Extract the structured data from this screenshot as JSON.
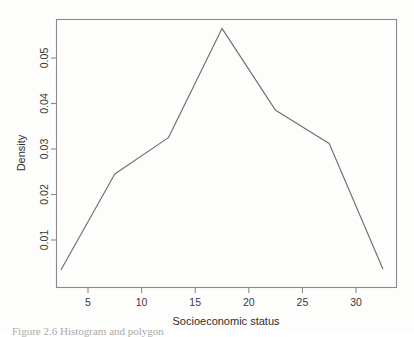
{
  "figure": {
    "caption": "Figure 2.6  Histogram and polygon",
    "background_color": "#fdfdfc",
    "line_color": "#6f6f6f",
    "axis_color": "#8a8a8a"
  },
  "chart_data": {
    "type": "line",
    "title": "",
    "subtitle": "",
    "xlabel": "Socioeconomic status",
    "ylabel": "Density",
    "x": [
      2.5,
      7.5,
      12.5,
      17.5,
      22.5,
      27.5,
      32.5
    ],
    "values": [
      0.0035,
      0.0245,
      0.0325,
      0.0565,
      0.0385,
      0.0312,
      0.0037
    ],
    "series": [
      {
        "name": "Density",
        "values": [
          0.0035,
          0.0245,
          0.0325,
          0.0565,
          0.0385,
          0.0312,
          0.0037
        ]
      }
    ],
    "xlim": [
      1.8,
      33.5
    ],
    "ylim": [
      0.0022,
      0.0585
    ],
    "xticks": [
      5,
      10,
      15,
      20,
      25,
      30
    ],
    "xticklabels": [
      "5",
      "10",
      "15",
      "20",
      "25",
      "30"
    ],
    "yticks": [
      0.01,
      0.02,
      0.03,
      0.04,
      0.05
    ],
    "yticklabels": [
      "0.01",
      "0.02",
      "0.03",
      "0.04",
      "0.05"
    ],
    "grid": false,
    "legend": false,
    "legend_position": "none",
    "box": true,
    "annotations": []
  }
}
